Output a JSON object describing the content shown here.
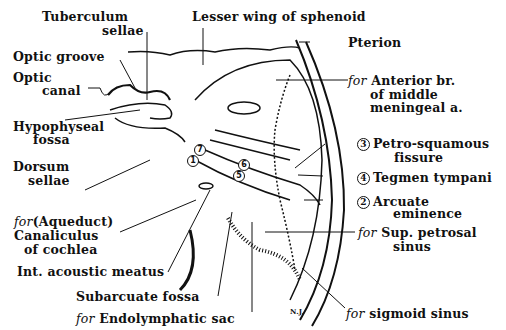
{
  "figure": {
    "signature": "N.J."
  },
  "labels": {
    "tuberculum": {
      "line1": "Tuberculum",
      "line2": "sellae"
    },
    "lesser_wing": "Lesser wing of sphenoid",
    "pterion": "Pterion",
    "optic_groove": "Optic groove",
    "optic_canal": {
      "line1": "Optic",
      "line2": "canal"
    },
    "hypophyseal": {
      "line1": "Hypophyseal",
      "line2": "fossa"
    },
    "dorsum": {
      "line1": "Dorsum",
      "line2": "sellae"
    },
    "anterior_br": {
      "prefix": "for",
      "line1": "Anterior br.",
      "line2": "of middle",
      "line3": "meningeal a."
    },
    "petro_squamous": {
      "num": "3",
      "line1": "Petro-squamous",
      "line2": "fissure"
    },
    "tegmen": {
      "num": "4",
      "text": "Tegmen tympani"
    },
    "arcuate": {
      "num": "2",
      "line1": "Arcuate",
      "line2": "eminence"
    },
    "sup_petrosal": {
      "prefix": "for",
      "line1": "Sup. petrosal",
      "line2": "sinus"
    },
    "aqueduct": {
      "prefix": "for",
      "line1": "(Aqueduct)",
      "line2": "Canaliculus",
      "line3": "of cochlea"
    },
    "int_acoustic": "Int. acoustic meatus",
    "subarcuate": "Subarcuate fossa",
    "endolymphatic": {
      "prefix": "for",
      "text": "Endolymphatic sac"
    },
    "sigmoid": {
      "prefix": "for",
      "text": "sigmoid sinus"
    }
  },
  "numbered_markers": [
    "7",
    "1",
    "6",
    "5"
  ]
}
